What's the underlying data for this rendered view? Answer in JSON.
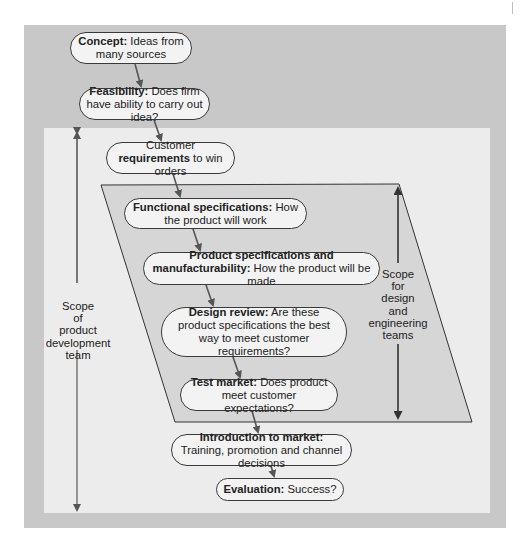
{
  "diagram": {
    "nodes": [
      {
        "id": "concept",
        "bold": "Concept:",
        "text": " Ideas from many sources"
      },
      {
        "id": "feasibility",
        "bold": "Feasibility:",
        "text": " Does firm have ability to carry out idea?"
      },
      {
        "id": "customer",
        "pre": "Customer ",
        "bold": "requirements",
        "text": " to win orders"
      },
      {
        "id": "functional",
        "bold": "Functional specifications:",
        "text": " How the product will work"
      },
      {
        "id": "product_specs",
        "bold": "Product specifications and manufacturability:",
        "text": " How the product will be made"
      },
      {
        "id": "design_review",
        "bold": "Design review:",
        "text": " Are these product specifications the best way to meet customer requirements?"
      },
      {
        "id": "test_market",
        "bold": "Test market:",
        "text": " Does product meet customer expectations?"
      },
      {
        "id": "introduction",
        "bold": "Introduction to market:",
        "text": " Training, promotion and channel decisions"
      },
      {
        "id": "evaluation",
        "bold": "Evaluation:",
        "text": " Success?"
      }
    ],
    "scope_labels": {
      "product_team": [
        "Scope",
        "of",
        "product",
        "development",
        "team"
      ],
      "design_team": [
        "Scope",
        "for",
        "design",
        "and",
        "engineering",
        "teams"
      ]
    },
    "colors": {
      "outer_panel": "#c8c8c8",
      "inner_panel": "#ececec",
      "parallelogram": "#d6d6d6",
      "node_fill": "#f3f3f3",
      "arrow": "#555555"
    }
  }
}
